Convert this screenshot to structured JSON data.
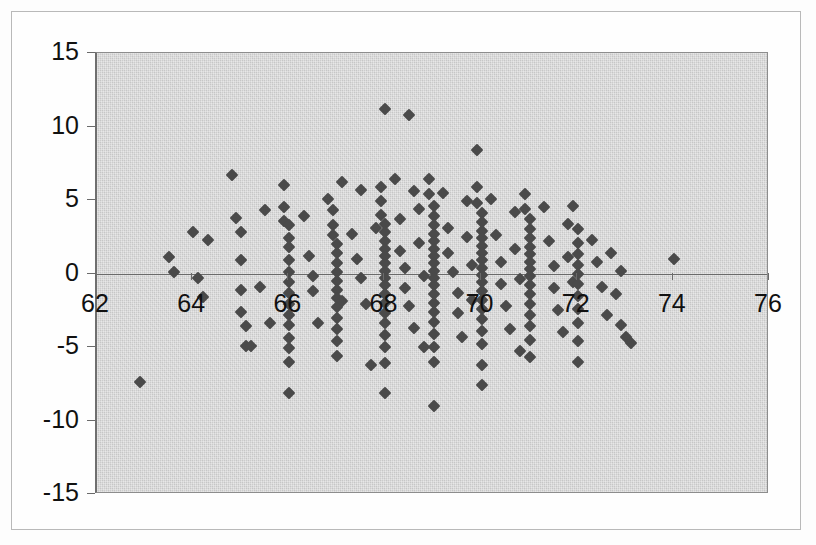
{
  "figure": {
    "name": "residual-scatter-plot",
    "background_color": "#fdfdfd",
    "panel_color": "#d3d3d3",
    "marker_color": "#4a4a4a",
    "axis_color": "#6a6a6a",
    "text_color": "#111111"
  },
  "chart_data": {
    "type": "scatter",
    "title": "",
    "subtitle": "",
    "xlabel": "",
    "ylabel": "",
    "xlim": [
      62,
      76
    ],
    "ylim": [
      -15,
      15
    ],
    "xticks": [
      62,
      64,
      66,
      68,
      70,
      72,
      74,
      76
    ],
    "yticks": [
      15,
      10,
      5,
      0,
      -5,
      -10,
      -15
    ],
    "xtick_labels": [
      "62",
      "64",
      "66",
      "68",
      "70",
      "72",
      "74",
      "76"
    ],
    "ytick_labels": [
      "15",
      "10",
      "5",
      "0",
      "-5",
      "-10",
      "-15"
    ],
    "grid": false,
    "legend": null,
    "annotations": [],
    "marker": "diamond",
    "series": [
      {
        "name": "residuals",
        "n_points": 372,
        "points": [
          [
            62.9,
            -7.4
          ],
          [
            63.5,
            1.1
          ],
          [
            63.6,
            0.1
          ],
          [
            64.0,
            2.8
          ],
          [
            64.1,
            -0.3
          ],
          [
            64.2,
            -1.6
          ],
          [
            64.3,
            2.3
          ],
          [
            64.8,
            6.7
          ],
          [
            64.9,
            3.8
          ],
          [
            65.0,
            2.8
          ],
          [
            65.0,
            0.9
          ],
          [
            65.0,
            -1.1
          ],
          [
            65.0,
            -2.6
          ],
          [
            65.1,
            -3.6
          ],
          [
            65.1,
            -4.9
          ],
          [
            65.2,
            -4.9
          ],
          [
            65.4,
            -0.9
          ],
          [
            65.5,
            4.3
          ],
          [
            65.6,
            -3.4
          ],
          [
            65.9,
            6.0
          ],
          [
            65.9,
            4.5
          ],
          [
            65.9,
            3.6
          ],
          [
            66.0,
            3.3
          ],
          [
            66.0,
            2.4
          ],
          [
            66.0,
            1.8
          ],
          [
            66.0,
            0.9
          ],
          [
            66.0,
            0.1
          ],
          [
            66.0,
            -0.6
          ],
          [
            66.0,
            -1.3
          ],
          [
            66.0,
            -2.1
          ],
          [
            66.0,
            -2.8
          ],
          [
            66.0,
            -3.5
          ],
          [
            66.0,
            -4.4
          ],
          [
            66.0,
            -5.1
          ],
          [
            66.0,
            -6.0
          ],
          [
            66.0,
            -8.1
          ],
          [
            66.3,
            3.9
          ],
          [
            66.4,
            1.2
          ],
          [
            66.5,
            -0.2
          ],
          [
            66.5,
            -1.2
          ],
          [
            66.6,
            -3.4
          ],
          [
            66.8,
            5.1
          ],
          [
            66.9,
            4.3
          ],
          [
            66.9,
            3.3
          ],
          [
            66.9,
            2.6
          ],
          [
            67.0,
            2.0
          ],
          [
            67.0,
            1.4
          ],
          [
            67.0,
            0.7
          ],
          [
            67.0,
            0.1
          ],
          [
            67.0,
            -0.5
          ],
          [
            67.0,
            -1.1
          ],
          [
            67.0,
            -1.7
          ],
          [
            67.0,
            -2.3
          ],
          [
            67.0,
            -3.0
          ],
          [
            67.0,
            -3.8
          ],
          [
            67.0,
            -4.6
          ],
          [
            67.0,
            -5.6
          ],
          [
            67.1,
            6.2
          ],
          [
            67.1,
            -1.9
          ],
          [
            67.3,
            2.7
          ],
          [
            67.4,
            1.0
          ],
          [
            67.5,
            -0.3
          ],
          [
            67.5,
            5.7
          ],
          [
            67.6,
            -2.1
          ],
          [
            67.7,
            -6.2
          ],
          [
            67.8,
            3.1
          ],
          [
            67.9,
            5.9
          ],
          [
            67.9,
            4.9
          ],
          [
            67.9,
            4.0
          ],
          [
            68.0,
            3.4
          ],
          [
            68.0,
            2.8
          ],
          [
            68.0,
            2.2
          ],
          [
            68.0,
            1.7
          ],
          [
            68.0,
            1.2
          ],
          [
            68.0,
            0.7
          ],
          [
            68.0,
            0.2
          ],
          [
            68.0,
            -0.3
          ],
          [
            68.0,
            -0.8
          ],
          [
            68.0,
            -1.4
          ],
          [
            68.0,
            -2.0
          ],
          [
            68.0,
            -2.7
          ],
          [
            68.0,
            -3.4
          ],
          [
            68.0,
            -4.2
          ],
          [
            68.0,
            -5.0
          ],
          [
            68.0,
            -6.1
          ],
          [
            68.0,
            -8.1
          ],
          [
            68.0,
            11.2
          ],
          [
            68.5,
            10.8
          ],
          [
            68.2,
            6.4
          ],
          [
            68.3,
            3.7
          ],
          [
            68.3,
            1.5
          ],
          [
            68.4,
            0.4
          ],
          [
            68.4,
            -1.0
          ],
          [
            68.5,
            -2.2
          ],
          [
            68.6,
            -3.7
          ],
          [
            68.6,
            5.6
          ],
          [
            68.7,
            4.4
          ],
          [
            68.7,
            2.1
          ],
          [
            68.8,
            -0.2
          ],
          [
            68.8,
            -5.0
          ],
          [
            68.9,
            6.4
          ],
          [
            68.9,
            5.4
          ],
          [
            69.0,
            4.6
          ],
          [
            69.0,
            3.9
          ],
          [
            69.0,
            3.3
          ],
          [
            69.0,
            2.7
          ],
          [
            69.0,
            2.2
          ],
          [
            69.0,
            1.7
          ],
          [
            69.0,
            1.2
          ],
          [
            69.0,
            0.7
          ],
          [
            69.0,
            0.2
          ],
          [
            69.0,
            -0.3
          ],
          [
            69.0,
            -0.8
          ],
          [
            69.0,
            -1.4
          ],
          [
            69.0,
            -2.0
          ],
          [
            69.0,
            -2.6
          ],
          [
            69.0,
            -3.3
          ],
          [
            69.0,
            -4.1
          ],
          [
            69.0,
            -5.0
          ],
          [
            69.0,
            -6.0
          ],
          [
            69.0,
            -9.0
          ],
          [
            69.2,
            5.5
          ],
          [
            69.3,
            3.1
          ],
          [
            69.3,
            1.4
          ],
          [
            69.4,
            0.1
          ],
          [
            69.5,
            -1.3
          ],
          [
            69.5,
            -2.7
          ],
          [
            69.6,
            -4.3
          ],
          [
            69.7,
            4.9
          ],
          [
            69.7,
            2.5
          ],
          [
            69.8,
            0.6
          ],
          [
            69.8,
            -1.8
          ],
          [
            69.9,
            8.4
          ],
          [
            69.9,
            5.9
          ],
          [
            69.9,
            4.8
          ],
          [
            70.0,
            4.1
          ],
          [
            70.0,
            3.5
          ],
          [
            70.0,
            2.9
          ],
          [
            70.0,
            2.4
          ],
          [
            70.0,
            1.9
          ],
          [
            70.0,
            1.4
          ],
          [
            70.0,
            0.9
          ],
          [
            70.0,
            0.4
          ],
          [
            70.0,
            -0.1
          ],
          [
            70.0,
            -0.6
          ],
          [
            70.0,
            -1.2
          ],
          [
            70.0,
            -1.8
          ],
          [
            70.0,
            -2.4
          ],
          [
            70.0,
            -3.1
          ],
          [
            70.0,
            -3.9
          ],
          [
            70.0,
            -4.8
          ],
          [
            70.0,
            -6.2
          ],
          [
            70.0,
            -7.6
          ],
          [
            70.2,
            5.1
          ],
          [
            70.3,
            2.6
          ],
          [
            70.4,
            0.8
          ],
          [
            70.4,
            -0.7
          ],
          [
            70.5,
            -2.2
          ],
          [
            70.6,
            -3.8
          ],
          [
            70.7,
            4.2
          ],
          [
            70.7,
            1.7
          ],
          [
            70.8,
            -0.4
          ],
          [
            70.8,
            -5.3
          ],
          [
            70.9,
            5.4
          ],
          [
            70.9,
            4.4
          ],
          [
            71.0,
            3.7
          ],
          [
            71.0,
            3.0
          ],
          [
            71.0,
            2.4
          ],
          [
            71.0,
            1.8
          ],
          [
            71.0,
            1.3
          ],
          [
            71.0,
            0.8
          ],
          [
            71.0,
            0.3
          ],
          [
            71.0,
            -0.2
          ],
          [
            71.0,
            -0.8
          ],
          [
            71.0,
            -1.4
          ],
          [
            71.0,
            -2.1
          ],
          [
            71.0,
            -2.8
          ],
          [
            71.0,
            -3.6
          ],
          [
            71.0,
            -4.5
          ],
          [
            71.0,
            -5.7
          ],
          [
            71.3,
            4.5
          ],
          [
            71.4,
            2.2
          ],
          [
            71.5,
            0.5
          ],
          [
            71.5,
            -1.0
          ],
          [
            71.6,
            -2.5
          ],
          [
            71.7,
            -4.0
          ],
          [
            71.8,
            3.4
          ],
          [
            71.8,
            1.1
          ],
          [
            71.9,
            -0.6
          ],
          [
            71.9,
            4.6
          ],
          [
            72.0,
            3.0
          ],
          [
            72.0,
            2.1
          ],
          [
            72.0,
            1.3
          ],
          [
            72.0,
            0.6
          ],
          [
            72.0,
            0.0
          ],
          [
            72.0,
            -0.7
          ],
          [
            72.0,
            -1.5
          ],
          [
            72.0,
            -2.4
          ],
          [
            72.0,
            -3.4
          ],
          [
            72.0,
            -4.6
          ],
          [
            72.0,
            -6.0
          ],
          [
            72.3,
            2.3
          ],
          [
            72.4,
            0.8
          ],
          [
            72.5,
            -0.9
          ],
          [
            72.6,
            -2.8
          ],
          [
            72.7,
            1.4
          ],
          [
            72.8,
            -1.4
          ],
          [
            72.9,
            0.2
          ],
          [
            72.9,
            -3.5
          ],
          [
            73.0,
            -4.3
          ],
          [
            73.1,
            -4.7
          ],
          [
            74.0,
            1.0
          ]
        ]
      }
    ]
  }
}
